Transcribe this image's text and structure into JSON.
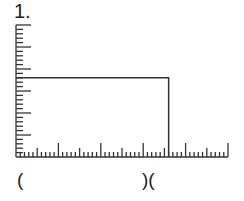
{
  "figure": {
    "number_label": "1.",
    "bottom_labels": [
      {
        "text": "(",
        "position": "left"
      },
      {
        "text": ")(",
        "position": "middle"
      }
    ],
    "colors": {
      "line": "#333333",
      "background": "#ffffff"
    }
  },
  "chart_data": {
    "type": "bar",
    "title": "1.",
    "xlabel": "",
    "ylabel": "",
    "x_tick_labels": [],
    "y_tick_labels": [],
    "x_axis": {
      "minor_ticks": 50,
      "major_every": 10,
      "mid_every": 5,
      "range": [
        0,
        50
      ]
    },
    "y_axis": {
      "minor_ticks": 30,
      "major_every": 5,
      "range": [
        0,
        30
      ]
    },
    "categories": [
      "segment"
    ],
    "series": [
      {
        "name": "rectangle",
        "x_start": 0,
        "x_end": 36,
        "height": 18
      }
    ],
    "annotations": [
      "(",
      ")("
    ],
    "grid": false,
    "legend": null
  }
}
